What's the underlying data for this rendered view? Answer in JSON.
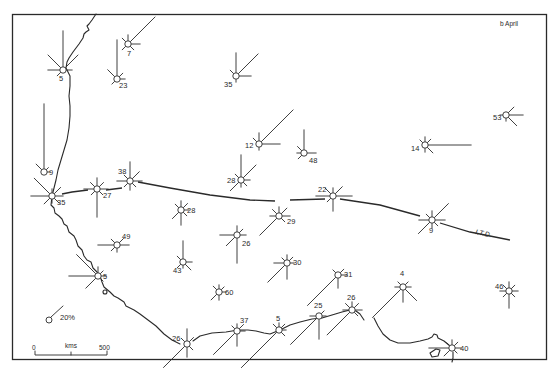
{
  "figure": {
    "panel_label": "b April",
    "itd_label": "I.T.D.",
    "legend": {
      "label": "20%",
      "ray_length_px": 14
    },
    "scale_bar": {
      "start_label": "0",
      "unit_label": "kms",
      "end_label": "500"
    }
  },
  "stations": [
    {
      "id": "s1",
      "calm": "5",
      "x": 63,
      "y": 70,
      "lx": -4,
      "ly": 11,
      "rays": [
        [
          90,
          36
        ],
        [
          135,
          18
        ],
        [
          45,
          18
        ],
        [
          180,
          12
        ],
        [
          0,
          6
        ],
        [
          225,
          5
        ]
      ]
    },
    {
      "id": "s2",
      "calm": "7",
      "x": 128,
      "y": 44,
      "lx": -1,
      "ly": 12,
      "rays": [
        [
          45,
          35
        ],
        [
          90,
          6
        ],
        [
          0,
          9
        ],
        [
          135,
          5
        ],
        [
          225,
          5
        ],
        [
          315,
          5
        ]
      ]
    },
    {
      "id": "s3",
      "calm": "23",
      "x": 117,
      "y": 79,
      "lx": 2,
      "ly": 9,
      "rays": [
        [
          90,
          36
        ],
        [
          135,
          10
        ],
        [
          45,
          5
        ],
        [
          0,
          5
        ],
        [
          225,
          4
        ]
      ]
    },
    {
      "id": "s4",
      "calm": "9",
      "x": 44,
      "y": 172,
      "lx": 5,
      "ly": 3,
      "rays": [
        [
          90,
          65
        ],
        [
          135,
          8
        ],
        [
          0,
          3
        ],
        [
          45,
          3
        ]
      ]
    },
    {
      "id": "s5",
      "calm": "35",
      "x": 52,
      "y": 196,
      "lx": 5,
      "ly": 9,
      "rays": [
        [
          135,
          22
        ],
        [
          180,
          18
        ],
        [
          45,
          9
        ],
        [
          0,
          8
        ],
        [
          225,
          8
        ],
        [
          315,
          7
        ],
        [
          90,
          4
        ],
        [
          270,
          4
        ]
      ]
    },
    {
      "id": "s6",
      "calm": "27",
      "x": 97,
      "y": 189,
      "lx": 6,
      "ly": 9,
      "rays": [
        [
          270,
          25
        ],
        [
          180,
          10
        ],
        [
          0,
          8
        ],
        [
          90,
          8
        ],
        [
          135,
          6
        ],
        [
          45,
          6
        ],
        [
          225,
          5
        ],
        [
          315,
          5
        ]
      ]
    },
    {
      "id": "s7",
      "calm": "38",
      "x": 130,
      "y": 181,
      "lx": -12,
      "ly": -7,
      "rays": [
        [
          90,
          16
        ],
        [
          45,
          10
        ],
        [
          180,
          10
        ],
        [
          0,
          9
        ],
        [
          270,
          6
        ],
        [
          135,
          5
        ],
        [
          225,
          5
        ],
        [
          315,
          5
        ]
      ]
    },
    {
      "id": "s8",
      "calm": "35",
      "x": 236,
      "y": 76,
      "lx": -12,
      "ly": 11,
      "rays": [
        [
          45,
          28
        ],
        [
          90,
          20
        ],
        [
          135,
          5
        ],
        [
          0,
          12
        ],
        [
          270,
          3
        ]
      ]
    },
    {
      "id": "s9",
      "calm": "12",
      "x": 259,
      "y": 144,
      "lx": -14,
      "ly": 4,
      "rays": [
        [
          45,
          45
        ],
        [
          0,
          18
        ],
        [
          90,
          8
        ],
        [
          135,
          5
        ],
        [
          270,
          3
        ]
      ]
    },
    {
      "id": "s10",
      "calm": "48",
      "x": 304,
      "y": 153,
      "lx": 5,
      "ly": 10,
      "rays": [
        [
          90,
          20
        ],
        [
          0,
          9
        ],
        [
          135,
          6
        ],
        [
          225,
          5
        ],
        [
          180,
          4
        ]
      ]
    },
    {
      "id": "s11",
      "calm": "28",
      "x": 241,
      "y": 180,
      "lx": -14,
      "ly": 3,
      "rays": [
        [
          90,
          22
        ],
        [
          45,
          18
        ],
        [
          225,
          12
        ],
        [
          0,
          6
        ],
        [
          270,
          4
        ],
        [
          315,
          5
        ],
        [
          135,
          5
        ]
      ]
    },
    {
      "id": "s12",
      "calm": "22",
      "x": 333,
      "y": 196,
      "lx": -15,
      "ly": -4,
      "rays": [
        [
          0,
          16
        ],
        [
          180,
          14
        ],
        [
          45,
          10
        ],
        [
          135,
          8
        ],
        [
          270,
          12
        ],
        [
          90,
          5
        ],
        [
          225,
          5
        ]
      ]
    },
    {
      "id": "s13",
      "calm": "29",
      "x": 279,
      "y": 216,
      "lx": 8,
      "ly": 8,
      "rays": [
        [
          225,
          24
        ],
        [
          45,
          8
        ],
        [
          90,
          6
        ],
        [
          135,
          6
        ],
        [
          0,
          8
        ],
        [
          180,
          6
        ],
        [
          315,
          5
        ]
      ]
    },
    {
      "id": "s14",
      "calm": "14",
      "x": 425,
      "y": 145,
      "lx": -14,
      "ly": 6,
      "rays": [
        [
          0,
          43
        ],
        [
          90,
          5
        ],
        [
          135,
          4
        ],
        [
          45,
          5
        ],
        [
          315,
          8
        ],
        [
          270,
          4
        ]
      ]
    },
    {
      "id": "s15",
      "calm": "53",
      "x": 506,
      "y": 115,
      "lx": -13,
      "ly": 5,
      "rays": [
        [
          0,
          14
        ],
        [
          45,
          8
        ],
        [
          315,
          12
        ],
        [
          270,
          3
        ],
        [
          180,
          3
        ]
      ]
    },
    {
      "id": "s16",
      "calm": "9",
      "x": 432,
      "y": 220,
      "lx": -3,
      "ly": 13,
      "rays": [
        [
          45,
          20
        ],
        [
          225,
          16
        ],
        [
          180,
          10
        ],
        [
          0,
          10
        ],
        [
          90,
          6
        ],
        [
          135,
          5
        ],
        [
          270,
          5
        ],
        [
          315,
          5
        ]
      ]
    },
    {
      "id": "s17",
      "calm": "28",
      "x": 181,
      "y": 210,
      "lx": 6,
      "ly": 3,
      "rays": [
        [
          270,
          12
        ],
        [
          225,
          9
        ],
        [
          90,
          6
        ],
        [
          45,
          6
        ],
        [
          135,
          5
        ],
        [
          0,
          5
        ],
        [
          315,
          5
        ]
      ]
    },
    {
      "id": "s18",
      "calm": "49",
      "x": 117,
      "y": 245,
      "lx": 5,
      "ly": -6,
      "rays": [
        [
          180,
          16
        ],
        [
          0,
          9
        ],
        [
          135,
          5
        ],
        [
          45,
          6
        ],
        [
          225,
          5
        ],
        [
          270,
          4
        ]
      ]
    },
    {
      "id": "s19",
      "calm": "26",
      "x": 237,
      "y": 235,
      "lx": 5,
      "ly": 11,
      "rays": [
        [
          270,
          25
        ],
        [
          180,
          14
        ],
        [
          225,
          12
        ],
        [
          0,
          6
        ],
        [
          90,
          6
        ],
        [
          45,
          5
        ]
      ]
    },
    {
      "id": "s20",
      "calm": "43",
      "x": 183,
      "y": 262,
      "lx": -10,
      "ly": 11,
      "rays": [
        [
          90,
          18
        ],
        [
          315,
          8
        ],
        [
          0,
          6
        ],
        [
          135,
          5
        ],
        [
          225,
          5
        ],
        [
          270,
          3
        ]
      ]
    },
    {
      "id": "s21",
      "calm": "30",
      "x": 287,
      "y": 263,
      "lx": 6,
      "ly": 2,
      "rays": [
        [
          225,
          24
        ],
        [
          270,
          13
        ],
        [
          180,
          10
        ],
        [
          45,
          5
        ],
        [
          90,
          5
        ],
        [
          0,
          4
        ],
        [
          135,
          4
        ]
      ]
    },
    {
      "id": "s22",
      "calm": "60",
      "x": 219,
      "y": 292,
      "lx": 6,
      "ly": 3,
      "rays": [
        [
          225,
          8
        ],
        [
          135,
          5
        ],
        [
          270,
          5
        ],
        [
          45,
          4
        ],
        [
          0,
          4
        ],
        [
          90,
          4
        ]
      ]
    },
    {
      "id": "s23",
      "calm": "31",
      "x": 338,
      "y": 275,
      "lx": 6,
      "ly": 2,
      "rays": [
        [
          225,
          40
        ],
        [
          270,
          10
        ],
        [
          0,
          6
        ],
        [
          45,
          5
        ],
        [
          135,
          4
        ]
      ]
    },
    {
      "id": "s24",
      "calm": "5",
      "x": 98,
      "y": 276,
      "lx": 5,
      "ly": 3,
      "rays": [
        [
          135,
          27
        ],
        [
          180,
          26
        ],
        [
          225,
          14
        ],
        [
          90,
          6
        ],
        [
          45,
          4
        ],
        [
          0,
          5
        ],
        [
          315,
          4
        ]
      ]
    },
    {
      "id": "s25",
      "calm": "4",
      "x": 403,
      "y": 287,
      "lx": -3,
      "ly": -11,
      "rays": [
        [
          225,
          40
        ],
        [
          270,
          12
        ],
        [
          315,
          16
        ],
        [
          0,
          5
        ],
        [
          180,
          5
        ],
        [
          45,
          4
        ],
        [
          135,
          4
        ]
      ]
    },
    {
      "id": "s26",
      "calm": "46",
      "x": 509,
      "y": 291,
      "lx": -14,
      "ly": -2,
      "rays": [
        [
          270,
          14
        ],
        [
          90,
          6
        ],
        [
          0,
          6
        ],
        [
          180,
          6
        ],
        [
          45,
          5
        ],
        [
          135,
          5
        ],
        [
          315,
          5
        ],
        [
          225,
          5
        ]
      ]
    },
    {
      "id": "s27",
      "calm": "26",
      "x": 352,
      "y": 310,
      "lx": -5,
      "ly": -10,
      "rays": [
        [
          225,
          32
        ],
        [
          135,
          6
        ],
        [
          45,
          6
        ],
        [
          0,
          7
        ],
        [
          180,
          6
        ],
        [
          90,
          5
        ],
        [
          315,
          5
        ]
      ]
    },
    {
      "id": "s28",
      "calm": "25",
      "x": 319,
      "y": 316,
      "lx": -5,
      "ly": -8,
      "rays": [
        [
          225,
          37
        ],
        [
          270,
          20
        ],
        [
          180,
          6
        ],
        [
          0,
          4
        ],
        [
          45,
          4
        ]
      ]
    },
    {
      "id": "s29",
      "calm": "5",
      "x": 279,
      "y": 330,
      "lx": -3,
      "ly": -9,
      "rays": [
        [
          225,
          50
        ],
        [
          45,
          5
        ],
        [
          135,
          5
        ],
        [
          315,
          5
        ],
        [
          0,
          4
        ],
        [
          90,
          4
        ]
      ]
    },
    {
      "id": "s30",
      "calm": "37",
      "x": 237,
      "y": 331,
      "lx": 3,
      "ly": -8,
      "rays": [
        [
          225,
          30
        ],
        [
          270,
          12
        ],
        [
          45,
          6
        ],
        [
          0,
          5
        ],
        [
          90,
          4
        ],
        [
          135,
          4
        ]
      ]
    },
    {
      "id": "s31",
      "calm": "26",
      "x": 187,
      "y": 344,
      "lx": -15,
      "ly": -3,
      "rays": [
        [
          225,
          30
        ],
        [
          90,
          12
        ],
        [
          270,
          10
        ],
        [
          45,
          6
        ],
        [
          315,
          5
        ],
        [
          135,
          5
        ]
      ]
    },
    {
      "id": "s32",
      "calm": "40",
      "x": 452,
      "y": 348,
      "lx": 8,
      "ly": 3,
      "rays": [
        [
          180,
          20
        ],
        [
          225,
          8
        ],
        [
          0,
          6
        ],
        [
          45,
          5
        ],
        [
          90,
          5
        ],
        [
          135,
          4
        ],
        [
          315,
          4
        ]
      ]
    }
  ]
}
